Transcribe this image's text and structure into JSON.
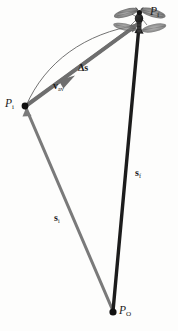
{
  "figure": {
    "type": "physics-vector-diagram",
    "background_color": "#fdfdfc",
    "width": 178,
    "height": 331,
    "colors": {
      "displacement_vector": "#6e6e6e",
      "initial_position_vector": "#7a7a7a",
      "final_position_vector": "#1c1c1c",
      "path_curve": "#5a5a5a",
      "point_marker": "#111111",
      "label_text": "#1a1a1a"
    },
    "points": [
      {
        "id": "Pf",
        "label_base": "P",
        "label_sub": "f",
        "x": 140,
        "y": 23,
        "marker": false
      },
      {
        "id": "Pi",
        "label_base": "P",
        "label_sub": "i",
        "x": 25,
        "y": 106,
        "marker": true
      },
      {
        "id": "PO",
        "label_base": "P",
        "label_sub": "O",
        "x": 113,
        "y": 312,
        "marker": true
      }
    ],
    "vectors": [
      {
        "id": "displacement",
        "label_base": "Δs",
        "label_sub": "",
        "from": "Pi",
        "to": "Pf",
        "style": "thick-gray-arrow",
        "label_x": 78,
        "label_y": 63
      },
      {
        "id": "average-velocity",
        "label_base": "v",
        "label_sub": "av",
        "along": "displacement",
        "style": "mid-arrowhead-gray",
        "label_x": 53,
        "label_y": 81
      },
      {
        "id": "final-position",
        "label_base": "s",
        "label_sub": "f",
        "from": "PO",
        "to": "Pf",
        "style": "thick-black-line",
        "label_x": 135,
        "label_y": 168
      },
      {
        "id": "initial-position",
        "label_base": "s",
        "label_sub": "i",
        "from": "PO",
        "to": "Pi",
        "style": "thick-gray-line",
        "label_x": 54,
        "label_y": 213
      }
    ],
    "path_curve": {
      "id": "flight-path",
      "description": "thin curved trajectory arcing from Pi up to Pf"
    },
    "insect": {
      "id": "insect-icon",
      "description": "dragonfly silhouette at final position Pf",
      "x": 137,
      "y": 22
    },
    "labels": {
      "Pf": {
        "base": "P",
        "sub": "f"
      },
      "Pi": {
        "base": "P",
        "sub": "i"
      },
      "PO": {
        "base": "P",
        "sub": "O"
      },
      "delta_s": {
        "base": "Δs",
        "sub": ""
      },
      "v_av": {
        "base": "v",
        "sub": "av"
      },
      "s_f": {
        "base": "s",
        "sub": "f"
      },
      "s_i": {
        "base": "s",
        "sub": "i"
      }
    }
  }
}
